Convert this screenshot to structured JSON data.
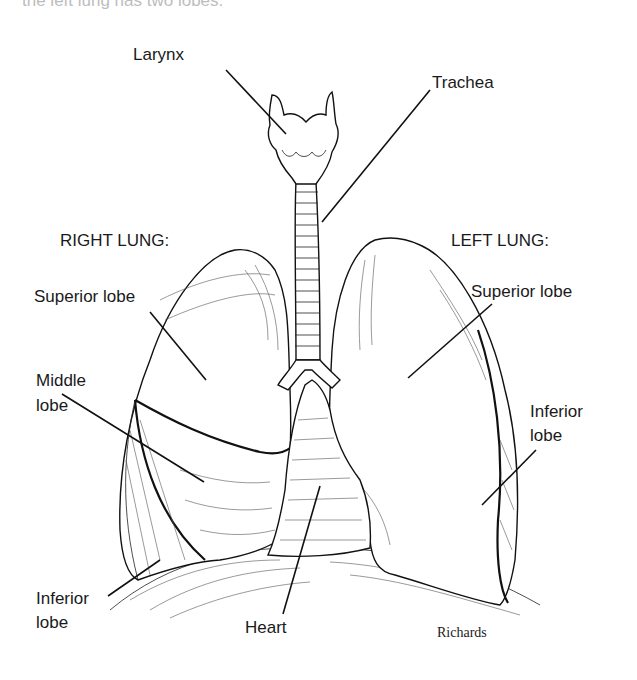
{
  "caption_fragment": "the left lung has two lobes.",
  "labels": {
    "larynx": "Larynx",
    "trachea": "Trachea",
    "right_lung": "RIGHT LUNG:",
    "left_lung": "LEFT LUNG:",
    "right_superior": "Superior lobe",
    "right_middle_1": "Middle",
    "right_middle_2": "lobe",
    "right_inferior_1": "Inferior",
    "right_inferior_2": "lobe",
    "left_superior": "Superior lobe",
    "left_inferior_1": "Inferior",
    "left_inferior_2": "lobe",
    "heart": "Heart"
  },
  "signature": "Richards"
}
